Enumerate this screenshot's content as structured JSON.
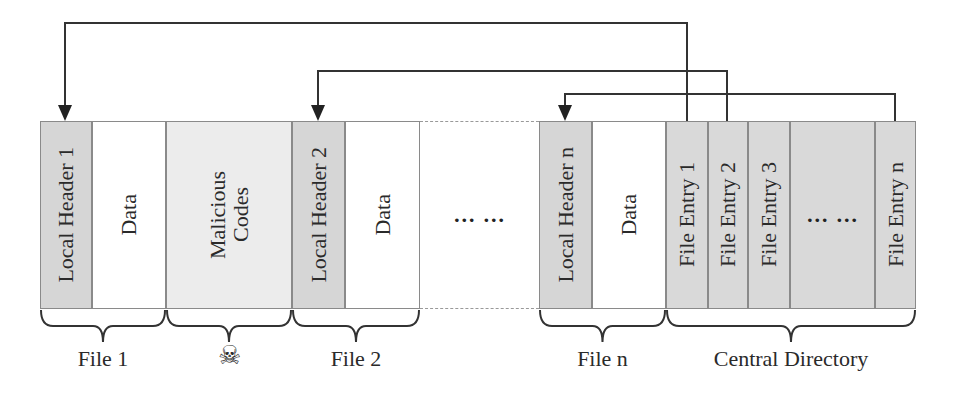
{
  "diagram": {
    "title": "",
    "segments": [
      {
        "id": "local-header-1",
        "label": "Local Header 1",
        "kind": "header",
        "x": 40,
        "w": 52
      },
      {
        "id": "data-1",
        "label": "Data",
        "kind": "data",
        "x": 92,
        "w": 74
      },
      {
        "id": "malicious-codes",
        "label": "Malicious\nCodes",
        "kind": "malicious",
        "x": 166,
        "w": 126
      },
      {
        "id": "local-header-2",
        "label": "Local Header 2",
        "kind": "header",
        "x": 292,
        "w": 53
      },
      {
        "id": "data-2",
        "label": "Data",
        "kind": "data",
        "x": 345,
        "w": 75
      },
      {
        "id": "gap",
        "label": "… …",
        "kind": "gap",
        "x": 420,
        "w": 119
      },
      {
        "id": "local-header-n",
        "label": "Local Header n",
        "kind": "header",
        "x": 539,
        "w": 53
      },
      {
        "id": "data-n",
        "label": "Data",
        "kind": "data",
        "x": 592,
        "w": 74
      },
      {
        "id": "file-entry-1",
        "label": "File Entry 1",
        "kind": "entry",
        "x": 666,
        "w": 42
      },
      {
        "id": "file-entry-2",
        "label": "File Entry 2",
        "kind": "entry",
        "x": 708,
        "w": 40
      },
      {
        "id": "file-entry-3",
        "label": "File Entry 3",
        "kind": "entry",
        "x": 748,
        "w": 42
      },
      {
        "id": "file-entry-dots",
        "label": "… …",
        "kind": "entry",
        "x": 790,
        "w": 85
      },
      {
        "id": "file-entry-n",
        "label": "File Entry n",
        "kind": "entry",
        "x": 875,
        "w": 41
      }
    ],
    "groups": [
      {
        "id": "file-1",
        "label": "File 1",
        "x1": 40,
        "x2": 166
      },
      {
        "id": "malicious",
        "label": "☠",
        "x1": 166,
        "x2": 292
      },
      {
        "id": "file-2",
        "label": "File 2",
        "x1": 292,
        "x2": 420
      },
      {
        "id": "file-n",
        "label": "File n",
        "x1": 539,
        "x2": 666
      },
      {
        "id": "central-directory",
        "label": "Central Directory",
        "x1": 666,
        "x2": 916
      }
    ],
    "arrows": [
      {
        "from": "file-entry-1",
        "to": "local-header-1",
        "from_x": 687,
        "to_x": 65,
        "y": 23
      },
      {
        "from": "file-entry-2",
        "to": "local-header-2",
        "from_x": 727,
        "to_x": 318,
        "y": 71
      },
      {
        "from": "file-entry-n",
        "to": "local-header-n",
        "from_x": 895,
        "to_x": 565,
        "y": 94
      }
    ],
    "colors": {
      "header_fill": "#d6d6d6",
      "entry_fill": "#d9d9d9",
      "malicious_fill": "#ececec",
      "data_fill": "#ffffff",
      "line": "#333333"
    }
  }
}
